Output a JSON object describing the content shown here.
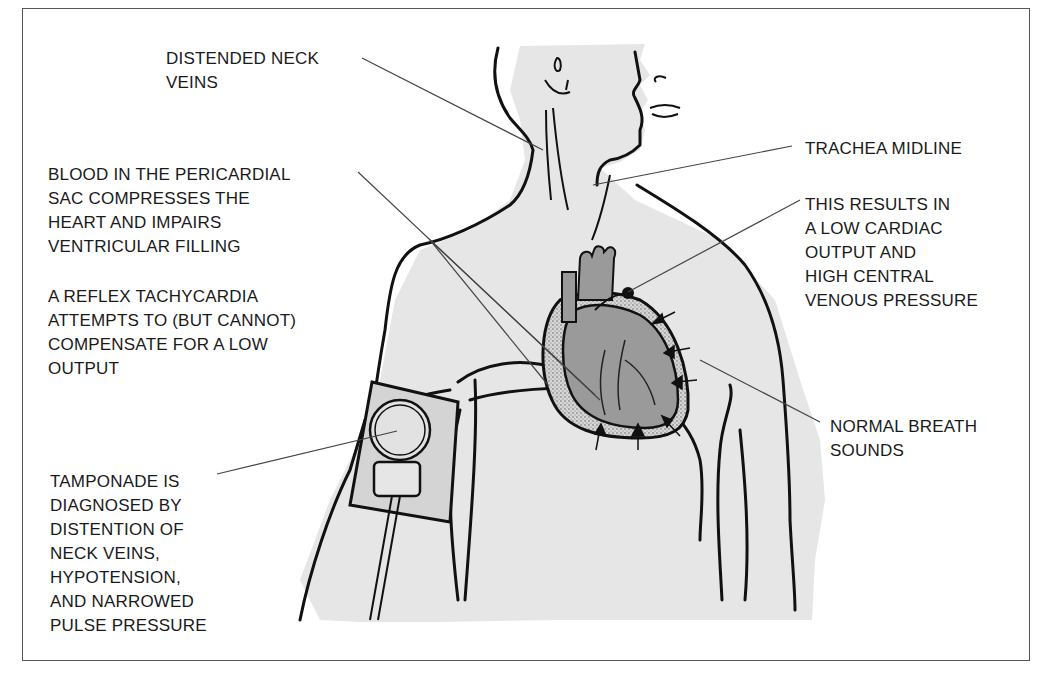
{
  "figure": {
    "colors": {
      "skin": "#e6e6e6",
      "heart": "#9a9a9a",
      "pericardial_blood": "#d0d0d0",
      "outline": "#111111",
      "leader": "#444444",
      "frame": "#555555"
    }
  },
  "labels": {
    "neck_veins": "DISTENDED NECK\nVEINS",
    "pericardial_blood": "BLOOD IN THE PERICARDIAL\nSAC COMPRESSES THE\nHEART AND IMPAIRS\nVENTRICULAR FILLING",
    "tachycardia": "A REFLEX TACHYCARDIA\nATTEMPTS TO (BUT CANNOT)\nCOMPENSATE FOR A LOW\nOUTPUT",
    "diagnosis": "TAMPONADE IS\nDIAGNOSED BY\nDISTENTION OF\nNECK VEINS,\nHYPOTENSION,\nAND NARROWED\nPULSE PRESSURE",
    "trachea": "TRACHEA MIDLINE",
    "cardiac_output": "THIS RESULTS IN\nA LOW CARDIAC\nOUTPUT AND\nHIGH CENTRAL\nVENOUS PRESSURE",
    "breath_sounds": "NORMAL BREATH\nSOUNDS"
  }
}
